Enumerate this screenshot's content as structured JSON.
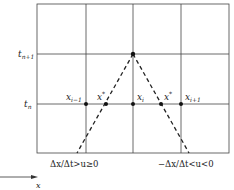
{
  "diagram": {
    "type": "characteristic-stencil",
    "time_levels": [
      {
        "label": "t",
        "sub": "n+1"
      },
      {
        "label": "t",
        "sub": "n"
      }
    ],
    "points": [
      {
        "label": "x",
        "sub": "i−1",
        "sup": ""
      },
      {
        "label": "x",
        "sub": "",
        "sup": "*"
      },
      {
        "label": "x",
        "sub": "i",
        "sup": ""
      },
      {
        "label": "x",
        "sub": "",
        "sup": "*"
      },
      {
        "label": "x",
        "sub": "i+1",
        "sup": ""
      }
    ],
    "captions": {
      "left": "Δx/Δt>u≥0",
      "right": "−Δx/Δt<u<0"
    },
    "axis_label": "x",
    "colors": {
      "line": "#333333",
      "point": "#111111"
    }
  }
}
